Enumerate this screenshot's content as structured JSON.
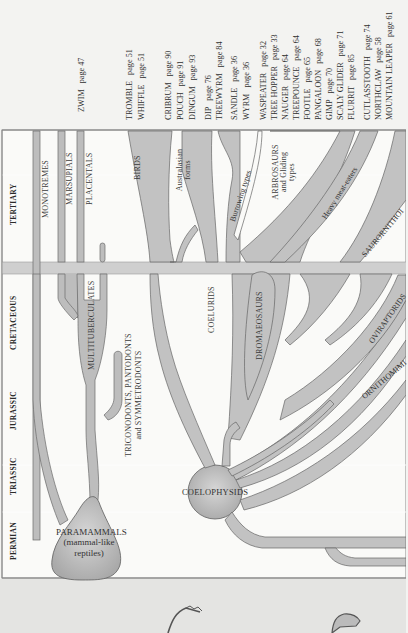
{
  "diagram": {
    "orientation": "rotated-90-ccw",
    "periods": [
      {
        "label": "TERTIARY"
      },
      {
        "label": "CRETACEOUS"
      },
      {
        "label": "JURASSIC"
      },
      {
        "label": "TRIASSIC"
      },
      {
        "label": "PERMIAN"
      }
    ],
    "mammal_lineages": {
      "monotremes": "MONOTREMES",
      "marsupials": "MARSUPIALS",
      "placentals": "PLACENTALS",
      "multituberculates": "MULTITUBERCULATES",
      "triconodonts_line1": "TRICONODONTS, PANTODONTS",
      "triconodonts_line2": "and SYMMETRODONTS",
      "paramammals_line1": "PARAMAMMALS",
      "paramammals_line2": "(mammal-like",
      "paramammals_line3": "reptiles)"
    },
    "dinosaur_lineages": {
      "coelophysids": "COELOPHYSIDS",
      "coelurids": "COELURIDS",
      "dromaeosaurs": "DROMAEOSAURS",
      "birds": "BIRDS",
      "australasian_line1": "Australasian",
      "australasian_line2": "forms",
      "burrowing": "Burrowing types",
      "arbrosaurs_line1": "ARBROSAURS",
      "arbrosaurs_line2": "and Gliding",
      "arbrosaurs_line3": "types",
      "heavy_meat_eaters": "Heavy meat-eaters",
      "saurornithoids": "SAURORNITHOI",
      "oviraptorids": "OVIRAPTORIDS",
      "ornithomimids": "ORNITHOMIMI"
    },
    "species_index": [
      {
        "name": "ZWIM",
        "page": "page 47"
      },
      {
        "name": "TROMBLE",
        "page": "page 51"
      },
      {
        "name": "WHIFFLE",
        "page": "page 51"
      },
      {
        "name": "CRIBRUM",
        "page": "page 90"
      },
      {
        "name": "POUCH",
        "page": "page 91"
      },
      {
        "name": "DINGUM",
        "page": "page 93"
      },
      {
        "name": "DIP",
        "page": "page 76"
      },
      {
        "name": "TREEWYRM",
        "page": "page 84"
      },
      {
        "name": "SANDLE",
        "page": "page 36"
      },
      {
        "name": "WYRM",
        "page": "page 36"
      },
      {
        "name": "WASPEATER",
        "page": "page 32"
      },
      {
        "name": "TREE HOPPER",
        "page": "page 33"
      },
      {
        "name": "NAUGER",
        "page": "page 64"
      },
      {
        "name": "TREEPOUNCE",
        "page": "page 64"
      },
      {
        "name": "FOOTLE",
        "page": "page 65"
      },
      {
        "name": "PANGALOON",
        "page": "page 68"
      },
      {
        "name": "GIMP",
        "page": "page 70"
      },
      {
        "name": "SCALY GLIDER",
        "page": "page 71"
      },
      {
        "name": "FLURRIT",
        "page": "page 85"
      },
      {
        "name": "CUTLASSTOOTH",
        "page": "page 74"
      },
      {
        "name": "NORTHCLAW",
        "page": "page 58"
      },
      {
        "name": "MOUNTAIN LEAPER",
        "page": "page 61"
      }
    ],
    "colors": {
      "background": "#f3f3f1",
      "branch_fill": "#c4c4c4",
      "branch_stroke": "#6a6a6a",
      "band": "#cfcfcf",
      "text": "#333333"
    }
  }
}
